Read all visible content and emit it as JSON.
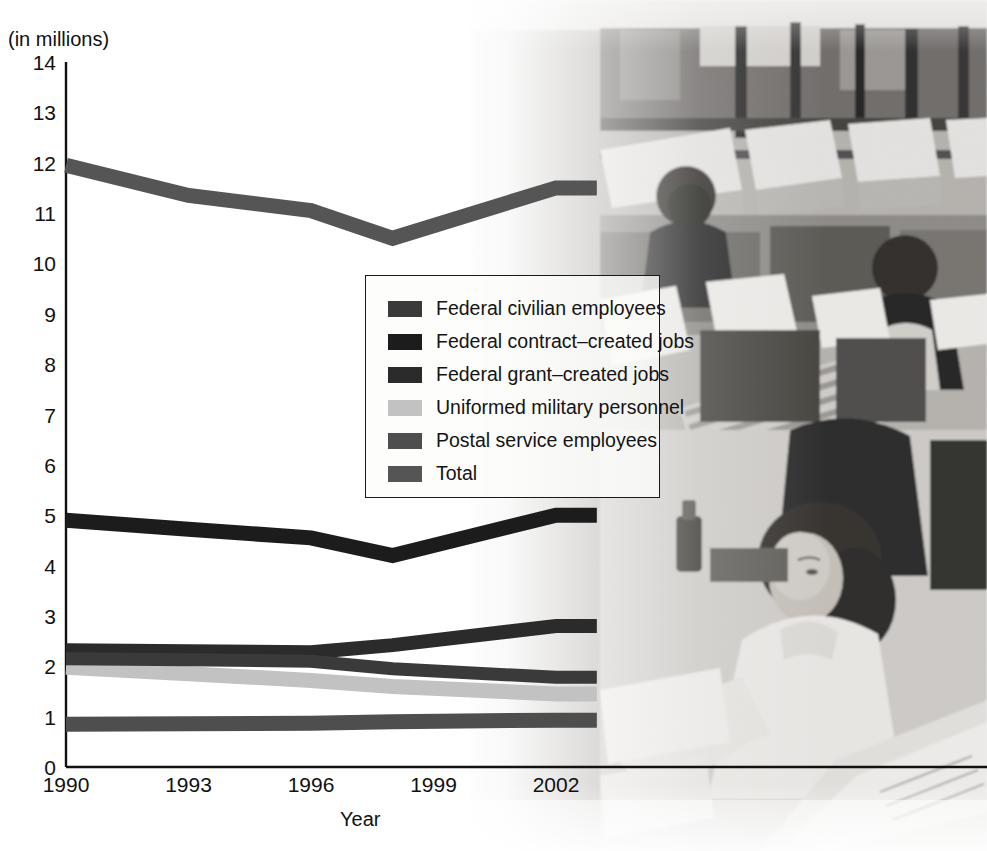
{
  "axes": {
    "y_unit_label": "(in millions)",
    "x_title": "Year",
    "y_ticks": [
      "14",
      "13",
      "12",
      "11",
      "10",
      "9",
      "8",
      "7",
      "6",
      "5",
      "4",
      "3",
      "2",
      "1",
      "0"
    ],
    "x_ticks": [
      "1990",
      "1993",
      "1996",
      "1999",
      "2002"
    ]
  },
  "legend": {
    "items": [
      {
        "label": "Federal civilian employees",
        "color": "#3a3a3a"
      },
      {
        "label": "Federal contract–created jobs",
        "color": "#1c1c1c"
      },
      {
        "label": "Federal grant–created jobs",
        "color": "#2b2b2b"
      },
      {
        "label": "Uniformed military personnel",
        "color": "#c2c2c2"
      },
      {
        "label": "Postal service employees",
        "color": "#4e4e4e"
      },
      {
        "label": "Total",
        "color": "#555555"
      }
    ]
  },
  "photo": {
    "alt": "Grayscale photograph of a mail sorting facility with workers at desks and mail trays"
  },
  "chart_data": {
    "type": "line",
    "title": "",
    "xlabel": "Year",
    "ylabel": "(in millions)",
    "xlim": [
      1990,
      2003
    ],
    "ylim": [
      0,
      14
    ],
    "grid": false,
    "legend_position": "center",
    "x": [
      1990,
      1993,
      1996,
      1998,
      2002,
      2003
    ],
    "series": [
      {
        "name": "Federal civilian employees",
        "color": "#3a3a3a",
        "values": [
          2.15,
          2.13,
          2.1,
          1.95,
          1.78,
          1.78
        ]
      },
      {
        "name": "Federal contract–created jobs",
        "color": "#1c1c1c",
        "values": [
          4.9,
          4.72,
          4.55,
          4.2,
          5.0,
          5.0
        ]
      },
      {
        "name": "Federal grant–created jobs",
        "color": "#2b2b2b",
        "values": [
          2.32,
          2.3,
          2.28,
          2.42,
          2.8,
          2.8
        ]
      },
      {
        "name": "Uniformed military personnel",
        "color": "#c2c2c2",
        "values": [
          1.98,
          1.85,
          1.72,
          1.6,
          1.45,
          1.45
        ]
      },
      {
        "name": "Postal service employees",
        "color": "#4e4e4e",
        "values": [
          0.85,
          0.86,
          0.87,
          0.9,
          0.93,
          0.93
        ]
      },
      {
        "name": "Total",
        "color": "#555555",
        "values": [
          11.95,
          11.35,
          11.05,
          10.5,
          11.5,
          11.5
        ]
      }
    ]
  }
}
